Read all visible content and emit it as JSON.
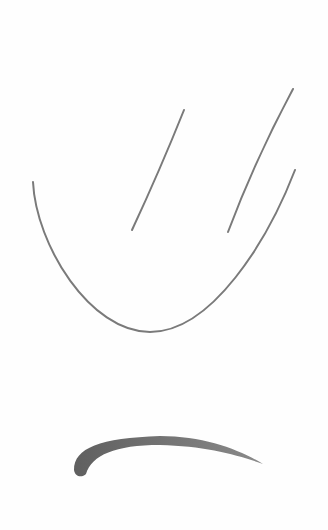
{
  "image": {
    "description": "Pencil sketch on white paper: two diagonal lines above a U-shaped curve, with a thick curved stroke below",
    "background_color": "#fefefe",
    "stroke_color": "#7a7a7a",
    "thick_stroke_color": "#6e6e6e"
  },
  "strokes": [
    {
      "name": "left-diagonal-line",
      "path": "M184,110 Q160,170 132,230"
    },
    {
      "name": "right-diagonal-line",
      "path": "M293,89 Q255,160 228,232"
    },
    {
      "name": "u-shaped-curve",
      "path": "M33,182 C40,250 90,332 150,332 C210,332 270,240 295,170"
    },
    {
      "name": "thick-curved-stroke",
      "path": "M80,470 C82,450 110,438 160,437 C200,437 240,450 262,463"
    }
  ]
}
